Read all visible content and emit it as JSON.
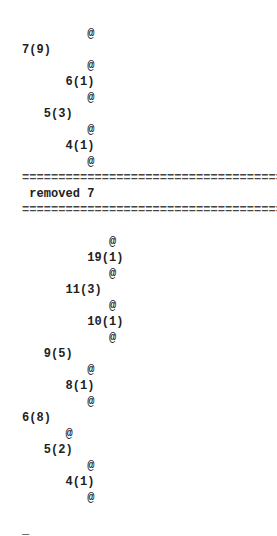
{
  "terminal": {
    "lines": [
      {
        "indent": 9,
        "text": "@",
        "kind": "node"
      },
      {
        "indent": 0,
        "text": "7(9)",
        "kind": "node"
      },
      {
        "indent": 9,
        "text": "@",
        "kind": "node"
      },
      {
        "indent": 6,
        "text": "6(1)",
        "kind": "node"
      },
      {
        "indent": 9,
        "text": "@",
        "kind": "node"
      },
      {
        "indent": 3,
        "text": "5(3)",
        "kind": "node"
      },
      {
        "indent": 9,
        "text": "@",
        "kind": "node"
      },
      {
        "indent": 6,
        "text": "4(1)",
        "kind": "node"
      },
      {
        "indent": 9,
        "text": "@",
        "kind": "node"
      },
      {
        "indent": 0,
        "text": "=====================================",
        "kind": "separator"
      },
      {
        "indent": 1,
        "text": "removed 7",
        "kind": "message"
      },
      {
        "indent": 0,
        "text": "=====================================",
        "kind": "separator"
      },
      {
        "indent": 0,
        "text": "",
        "kind": "blank"
      },
      {
        "indent": 12,
        "text": "@",
        "kind": "node"
      },
      {
        "indent": 9,
        "text": "19(1)",
        "kind": "node"
      },
      {
        "indent": 12,
        "text": "@",
        "kind": "node"
      },
      {
        "indent": 6,
        "text": "11(3)",
        "kind": "node"
      },
      {
        "indent": 12,
        "text": "@",
        "kind": "node"
      },
      {
        "indent": 9,
        "text": "10(1)",
        "kind": "node"
      },
      {
        "indent": 12,
        "text": "@",
        "kind": "node"
      },
      {
        "indent": 3,
        "text": "9(5)",
        "kind": "node"
      },
      {
        "indent": 9,
        "text": "@",
        "kind": "node"
      },
      {
        "indent": 6,
        "text": "8(1)",
        "kind": "node"
      },
      {
        "indent": 9,
        "text": "@",
        "kind": "node"
      },
      {
        "indent": 0,
        "text": "6(8)",
        "kind": "node"
      },
      {
        "indent": 6,
        "text": "@",
        "kind": "node"
      },
      {
        "indent": 3,
        "text": "5(2)",
        "kind": "node"
      },
      {
        "indent": 9,
        "text": "@",
        "kind": "node"
      },
      {
        "indent": 6,
        "text": "4(1)",
        "kind": "node"
      },
      {
        "indent": 9,
        "text": "@",
        "kind": "node"
      },
      {
        "indent": 0,
        "text": "",
        "kind": "blank"
      },
      {
        "indent": 0,
        "text": "_",
        "kind": "cursor"
      }
    ]
  }
}
